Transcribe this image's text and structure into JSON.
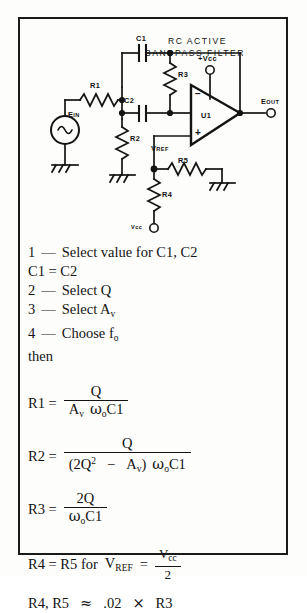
{
  "figure": {
    "title_line1": "RC ACTIVE",
    "title_line2": "BANDPASS FILTER"
  },
  "schematic": {
    "labels": {
      "c1": "C1",
      "c2": "C2",
      "r1": "R1",
      "r2": "R2",
      "r3": "R3",
      "r4": "R4",
      "r5": "R5",
      "u1": "U1",
      "ein_main": "E",
      "ein_sub": "IN",
      "eout_main": "E",
      "eout_sub": "OUT",
      "vcc_pos": "+Vcc",
      "vcc_bottom": "Vcc",
      "vref_main": "V",
      "vref_sub": "REF",
      "opamp_minus": "−",
      "opamp_plus": "+"
    },
    "colors": {
      "ink": "#141414",
      "paper": "#fdfdfb"
    }
  },
  "procedure": {
    "steps": [
      {
        "num": "1",
        "dash": "—",
        "text": "Select value for C1, C2"
      },
      {
        "num": "",
        "dash": "",
        "text": "C1  =   C2"
      },
      {
        "num": "2",
        "dash": "—",
        "text": "Select Q"
      },
      {
        "num": "3",
        "dash": "—",
        "text": "Select A"
      },
      {
        "num": "4",
        "dash": "—",
        "text": "Choose f"
      },
      {
        "num": "",
        "dash": "",
        "text": "then"
      }
    ],
    "step3_sub": "v",
    "step4_sub": "o"
  },
  "equations": {
    "r1": {
      "lhs": "R1  =",
      "num": "Q",
      "den_a": "A",
      "den_a_sub": "v",
      "den_omega": "ω",
      "den_omega_sub": "o",
      "den_c": "C1"
    },
    "r2": {
      "lhs": "R2  =",
      "num": "Q",
      "den_open": "(2Q",
      "den_sup": "2",
      "den_minus": "−",
      "den_a": "A",
      "den_a_sub": "v",
      "den_close": ")",
      "den_omega": "ω",
      "den_omega_sub": "o",
      "den_c": "C1"
    },
    "r3": {
      "lhs": "R3  =",
      "num": "2Q",
      "den_omega": "ω",
      "den_omega_sub": "o",
      "den_c": "C1"
    },
    "r4": {
      "lhs": "R4  =  R5  for",
      "v": "V",
      "v_sub": "REF",
      "eq": "=",
      "num": "V",
      "num_sub": "cc",
      "den": "2"
    },
    "r45": {
      "text_a": "R4, R5",
      "approx": "≈",
      "text_b": ".02",
      "times": "×",
      "text_c": "R3"
    }
  }
}
